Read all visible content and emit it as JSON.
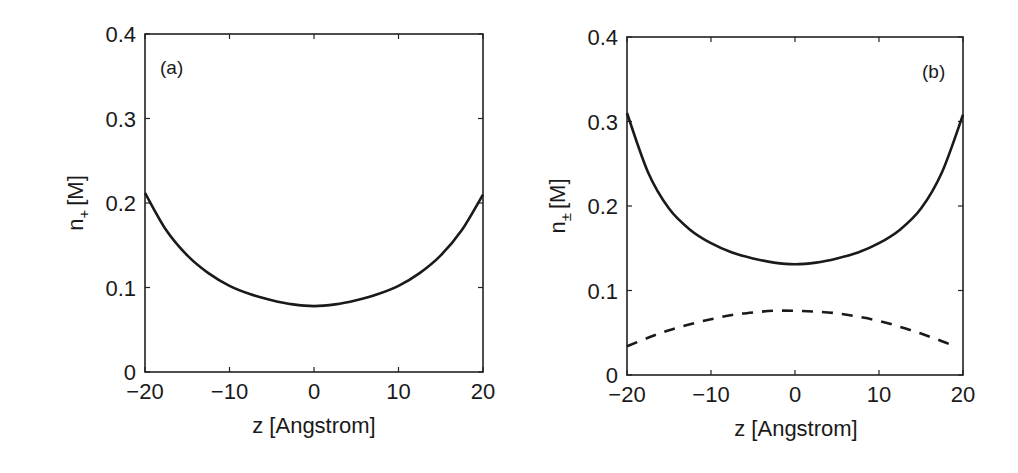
{
  "chart_data": [
    {
      "type": "line",
      "panel_label": "(a)",
      "xlabel": "z [Angstrom]",
      "ylabel": "n",
      "ylabel_sub": "+",
      "ylabel_unit": "[M]",
      "xlim": [
        -20,
        20
      ],
      "ylim": [
        0,
        0.4
      ],
      "xticks": [
        -20,
        -10,
        0,
        10,
        20
      ],
      "xtick_labels": [
        "−20",
        "−10",
        "0",
        "10",
        "20"
      ],
      "yticks": [
        0,
        0.1,
        0.2,
        0.3,
        0.4
      ],
      "ytick_labels": [
        "0",
        "0.1",
        "0.2",
        "0.3",
        "0.4"
      ],
      "grid": false,
      "series": [
        {
          "name": "n+",
          "style": "solid",
          "x": [
            -20,
            -17.5,
            -15,
            -12.5,
            -10,
            -7.5,
            -5,
            -2.5,
            0,
            2.5,
            5,
            7.5,
            10,
            12.5,
            15,
            17.5,
            20
          ],
          "y": [
            0.212,
            0.168,
            0.138,
            0.117,
            0.102,
            0.092,
            0.085,
            0.08,
            0.078,
            0.08,
            0.085,
            0.092,
            0.102,
            0.117,
            0.138,
            0.168,
            0.21
          ]
        }
      ]
    },
    {
      "type": "line",
      "panel_label": "(b)",
      "xlabel": "z [Angstrom]",
      "ylabel": "n",
      "ylabel_sub": "±",
      "ylabel_unit": "[M]",
      "xlim": [
        -20,
        20
      ],
      "ylim": [
        0,
        0.4
      ],
      "xticks": [
        -20,
        -10,
        0,
        10,
        20
      ],
      "xtick_labels": [
        "−20",
        "−10",
        "0",
        "10",
        "20"
      ],
      "yticks": [
        0,
        0.1,
        0.2,
        0.3,
        0.4
      ],
      "ytick_labels": [
        "0",
        "0.1",
        "0.2",
        "0.3",
        "0.4"
      ],
      "grid": false,
      "series": [
        {
          "name": "n+",
          "style": "solid",
          "x": [
            -20,
            -17.5,
            -15,
            -12.5,
            -10,
            -7.5,
            -5,
            -2.5,
            0,
            2.5,
            5,
            7.5,
            10,
            12.5,
            15,
            17.5,
            20
          ],
          "y": [
            0.31,
            0.24,
            0.197,
            0.172,
            0.156,
            0.145,
            0.138,
            0.133,
            0.131,
            0.133,
            0.138,
            0.145,
            0.156,
            0.172,
            0.197,
            0.24,
            0.308
          ]
        },
        {
          "name": "n-",
          "style": "dashed",
          "x": [
            -20,
            -17.5,
            -15,
            -12.5,
            -10,
            -7.5,
            -5,
            -2.5,
            0,
            2.5,
            5,
            7.5,
            10,
            12.5,
            15,
            17.5,
            18.5
          ],
          "y": [
            0.034,
            0.044,
            0.053,
            0.06,
            0.066,
            0.071,
            0.074,
            0.076,
            0.076,
            0.075,
            0.073,
            0.069,
            0.064,
            0.057,
            0.049,
            0.04,
            0.036
          ]
        }
      ]
    }
  ]
}
